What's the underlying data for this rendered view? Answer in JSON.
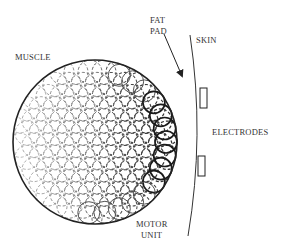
{
  "labels": {
    "muscle": "MUSCLE",
    "fat_pad_line1": "FAT",
    "fat_pad_line2": "PAD",
    "skin": "SKIN",
    "electrodes": "ELECTRODES",
    "motor_unit_line1": "MOTOR",
    "motor_unit_line2": "UNIT"
  },
  "colors": {
    "stroke": "#222222",
    "dashed_light": "#888888",
    "dashed_dark": "#333333"
  }
}
